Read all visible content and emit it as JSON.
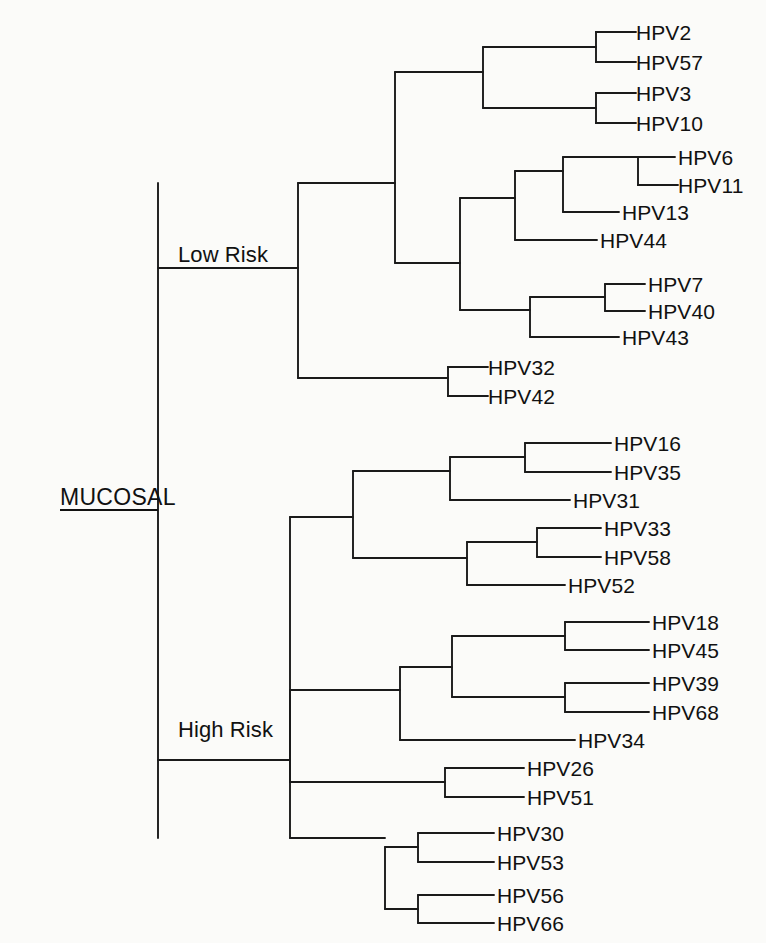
{
  "figure": {
    "type": "phylogenetic-tree",
    "orientation": "left-to-right-rectangular-cladogram",
    "background_color": "#fbfbf9",
    "line_color": "#1a1a1a",
    "text_color": "#111111"
  },
  "root": {
    "label": "MUCOSAL",
    "underlined": true,
    "x": 158,
    "y": 510
  },
  "internal_labels": [
    {
      "name": "low-risk",
      "label": "Low Risk",
      "x": 178,
      "y": 268
    },
    {
      "name": "high-risk",
      "label": "High Risk",
      "x": 178,
      "y": 743
    }
  ],
  "leaves": [
    {
      "label": "HPV2",
      "x": 636,
      "y": 32,
      "tip_x": 596
    },
    {
      "label": "HPV57",
      "x": 636,
      "y": 62,
      "tip_x": 596
    },
    {
      "label": "HPV3",
      "x": 636,
      "y": 93,
      "tip_x": 596
    },
    {
      "label": "HPV10",
      "x": 636,
      "y": 123,
      "tip_x": 596
    },
    {
      "label": "HPV6",
      "x": 678,
      "y": 157,
      "tip_x": 638
    },
    {
      "label": "HPV11",
      "x": 678,
      "y": 185,
      "tip_x": 638
    },
    {
      "label": "HPV13",
      "x": 622,
      "y": 212,
      "tip_x": 582
    },
    {
      "label": "HPV44",
      "x": 600,
      "y": 240,
      "tip_x": 560
    },
    {
      "label": "HPV7",
      "x": 648,
      "y": 284,
      "tip_x": 608
    },
    {
      "label": "HPV40",
      "x": 648,
      "y": 311,
      "tip_x": 608
    },
    {
      "label": "HPV43",
      "x": 622,
      "y": 337,
      "tip_x": 582
    },
    {
      "label": "HPV32",
      "x": 488,
      "y": 367,
      "tip_x": 448
    },
    {
      "label": "HPV42",
      "x": 488,
      "y": 396,
      "tip_x": 448
    },
    {
      "label": "HPV16",
      "x": 614,
      "y": 443,
      "tip_x": 574
    },
    {
      "label": "HPV35",
      "x": 614,
      "y": 472,
      "tip_x": 574
    },
    {
      "label": "HPV31",
      "x": 573,
      "y": 500,
      "tip_x": 533
    },
    {
      "label": "HPV33",
      "x": 604,
      "y": 528,
      "tip_x": 564
    },
    {
      "label": "HPV58",
      "x": 604,
      "y": 557,
      "tip_x": 564
    },
    {
      "label": "HPV52",
      "x": 568,
      "y": 585,
      "tip_x": 528
    },
    {
      "label": "HPV18",
      "x": 652,
      "y": 622,
      "tip_x": 612
    },
    {
      "label": "HPV45",
      "x": 652,
      "y": 650,
      "tip_x": 612
    },
    {
      "label": "HPV39",
      "x": 652,
      "y": 683,
      "tip_x": 612
    },
    {
      "label": "HPV68",
      "x": 652,
      "y": 712,
      "tip_x": 612
    },
    {
      "label": "HPV34",
      "x": 578,
      "y": 740,
      "tip_x": 538
    },
    {
      "label": "HPV26",
      "x": 527,
      "y": 768,
      "tip_x": 487
    },
    {
      "label": "HPV51",
      "x": 527,
      "y": 797,
      "tip_x": 487
    },
    {
      "label": "HPV30",
      "x": 497,
      "y": 833,
      "tip_x": 457
    },
    {
      "label": "HPV53",
      "x": 497,
      "y": 862,
      "tip_x": 457
    },
    {
      "label": "HPV56",
      "x": 497,
      "y": 895,
      "tip_x": 457
    },
    {
      "label": "HPV66",
      "x": 497,
      "y": 923,
      "tip_x": 457
    }
  ],
  "tree_paths": [
    "M 158,183 L 158,838",
    "M 158,268 L 298,268",
    "M 158,760 L 290,760",
    "M 298,183 L 298,378",
    "M 298,183 L 395,183",
    "M 298,378 L 448,378",
    "M 395,72 L 395,263",
    "M 395,72 L 483,72",
    "M 395,263 L 460,263",
    "M 483,47 L 483,108",
    "M 483,47 L 596,47",
    "M 483,108 L 596,108",
    "M 596,32 L 596,62",
    "M 596,32 L 636,32",
    "M 596,62 L 636,62",
    "M 596,93 L 596,123",
    "M 596,93 L 636,93",
    "M 596,123 L 636,123",
    "M 460,198 L 460,310",
    "M 460,198 L 515,198",
    "M 460,310 L 530,310",
    "M 515,171 L 515,240",
    "M 515,171 L 563,171",
    "M 515,240 L 560,240",
    "M 563,157 L 563,212",
    "M 563,157 L 638,157",
    "M 563,212 L 582,212",
    "M 638,157 L 638,185",
    "M 638,185 L 678,185",
    "M 530,297 L 530,337",
    "M 530,297 L 605,297",
    "M 530,337 L 582,337",
    "M 605,284 L 605,311",
    "M 605,284 L 608,284",
    "M 605,311 L 608,311",
    "M 448,367 L 448,396",
    "M 448,367 L 488,367",
    "M 448,396 L 488,396",
    "M 290,517 L 290,838",
    "M 290,517 L 353,517",
    "M 290,838 L 385,838",
    "M 353,471 L 353,558",
    "M 353,471 L 450,471",
    "M 353,558 L 467,558",
    "M 450,457 L 450,500",
    "M 450,457 L 525,457",
    "M 450,500 L 533,500",
    "M 525,443 L 525,472",
    "M 525,443 L 574,443",
    "M 525,472 L 574,472",
    "M 467,542 L 467,585",
    "M 467,542 L 537,542",
    "M 467,585 L 528,585",
    "M 537,528 L 537,557",
    "M 537,528 L 564,528",
    "M 537,557 L 564,557",
    "M 290,690 L 290,782",
    "M 290,690 L 400,690",
    "M 290,782 L 445,782",
    "M 400,667 L 400,740",
    "M 400,667 L 452,667",
    "M 400,740 L 538,740",
    "M 452,636 L 452,697",
    "M 452,636 L 565,636",
    "M 452,697 L 565,697",
    "M 565,622 L 565,650",
    "M 565,622 L 612,622",
    "M 565,650 L 612,650",
    "M 565,683 L 565,712",
    "M 565,683 L 612,683",
    "M 565,712 L 612,712",
    "M 445,768 L 445,797",
    "M 445,768 L 487,768",
    "M 445,797 L 487,797",
    "M 385,847 L 385,909",
    "M 385,847 L 418,847",
    "M 385,909 L 418,909",
    "M 418,833 L 418,862",
    "M 418,833 L 457,833",
    "M 418,862 L 457,862",
    "M 418,895 L 418,923",
    "M 418,895 L 457,895",
    "M 418,923 L 457,923"
  ]
}
